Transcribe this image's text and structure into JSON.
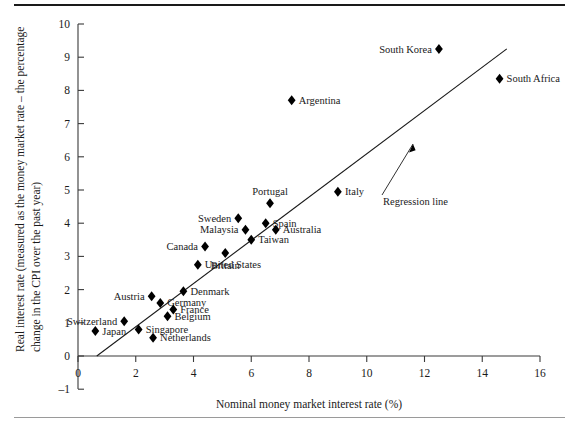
{
  "figure": {
    "top_rule": "top-border-rule",
    "bottom_rule": "bottom-border-rule"
  },
  "chart_data": {
    "type": "scatter",
    "title": "",
    "xlabel": "Nominal money market interest rate (%)",
    "ylabel": "Real interest rate (measured as the money market rate – the percentage change in the CPI over the past year)",
    "ylabel_line1": "Real interest rate (measured as the money market rate – the percentage",
    "ylabel_line2": "change in the CPI over the past year)",
    "xlim": [
      0,
      16
    ],
    "ylim": [
      -1,
      10
    ],
    "xticks": [
      0,
      2,
      4,
      6,
      8,
      10,
      12,
      14,
      16
    ],
    "xtick_labels": [
      "0",
      "2",
      "4",
      "6",
      "8",
      "10",
      "12",
      "14",
      "16"
    ],
    "yticks": [
      -1,
      0,
      1,
      2,
      3,
      4,
      5,
      6,
      7,
      8,
      9,
      10
    ],
    "ytick_labels": [
      "–1",
      "0",
      "1",
      "2",
      "3",
      "4",
      "5",
      "6",
      "7",
      "8",
      "9",
      "10"
    ],
    "grid": false,
    "legend": false,
    "marker": "diamond",
    "marker_color": "#000000",
    "points": [
      {
        "label": "Japan",
        "x": 0.6,
        "y": 0.75,
        "label_pos": "right"
      },
      {
        "label": "Switzerland",
        "x": 1.6,
        "y": 1.05,
        "label_pos": "left"
      },
      {
        "label": "Singapore",
        "x": 2.1,
        "y": 0.8,
        "label_pos": "right"
      },
      {
        "label": "Netherlands",
        "x": 2.6,
        "y": 0.55,
        "label_pos": "right"
      },
      {
        "label": "Austria",
        "x": 2.55,
        "y": 1.8,
        "label_pos": "left"
      },
      {
        "label": "Germany",
        "x": 2.85,
        "y": 1.6,
        "label_pos": "right"
      },
      {
        "label": "Belgium",
        "x": 3.1,
        "y": 1.2,
        "label_pos": "right"
      },
      {
        "label": "France",
        "x": 3.3,
        "y": 1.4,
        "label_pos": "right"
      },
      {
        "label": "Denmark",
        "x": 3.65,
        "y": 1.95,
        "label_pos": "right"
      },
      {
        "label": "United States",
        "x": 4.15,
        "y": 2.75,
        "label_pos": "right"
      },
      {
        "label": "Canada",
        "x": 4.4,
        "y": 3.3,
        "label_pos": "left"
      },
      {
        "label": "Britain",
        "x": 5.1,
        "y": 3.1,
        "label_pos": "below"
      },
      {
        "label": "Sweden",
        "x": 5.55,
        "y": 4.15,
        "label_pos": "left"
      },
      {
        "label": "Malaysia",
        "x": 5.8,
        "y": 3.8,
        "label_pos": "left"
      },
      {
        "label": "Taiwan",
        "x": 6.0,
        "y": 3.5,
        "label_pos": "right"
      },
      {
        "label": "Spain",
        "x": 6.5,
        "y": 4.0,
        "label_pos": "right"
      },
      {
        "label": "Portugal",
        "x": 6.65,
        "y": 4.6,
        "label_pos": "above"
      },
      {
        "label": "Australia",
        "x": 6.85,
        "y": 3.8,
        "label_pos": "right"
      },
      {
        "label": "Argentina",
        "x": 7.4,
        "y": 7.7,
        "label_pos": "right"
      },
      {
        "label": "Italy",
        "x": 9.0,
        "y": 4.95,
        "label_pos": "right"
      },
      {
        "label": "South Korea",
        "x": 12.5,
        "y": 9.25,
        "label_pos": "left"
      },
      {
        "label": "South Africa",
        "x": 14.6,
        "y": 8.35,
        "label_pos": "right"
      }
    ],
    "trendline": {
      "name": "Regression line",
      "annotation": "Regression line",
      "x_start": 0.65,
      "y_start": 0.0,
      "x_end": 14.85,
      "y_end": 9.25
    }
  }
}
